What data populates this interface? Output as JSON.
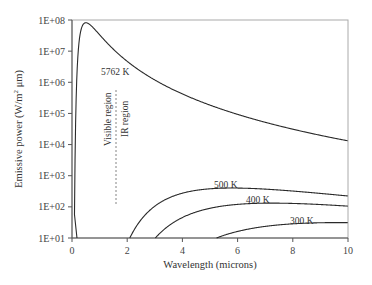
{
  "chart_data": {
    "type": "line",
    "title": "",
    "xlabel": "Wavelength (microns)",
    "ylabel": "Emissive power (W/m² μm)",
    "xlim": [
      0,
      10
    ],
    "ylim": [
      10,
      100000000
    ],
    "yscale": "log",
    "grid": false,
    "legend": "none (inline labels)",
    "x_ticks": [
      "0",
      "2",
      "4",
      "6",
      "8",
      "10"
    ],
    "y_ticks": [
      "1E+01",
      "1E+02",
      "1E+03",
      "1E+04",
      "1E+05",
      "1E+06",
      "1E+07",
      "1E+08"
    ],
    "series": [
      {
        "name": "5762 K",
        "temperature_K": 5762,
        "label": "5762 K",
        "x": [
          0.2,
          0.3,
          0.5,
          1.0,
          2.0,
          4.0,
          6.0,
          8.0,
          10.0
        ],
        "values": [
          10000000.0,
          50000000.0,
          85000000.0,
          45000000.0,
          7500000.0,
          550000.0,
          120000.0,
          39000.0,
          16000.0
        ]
      },
      {
        "name": "500 K",
        "temperature_K": 500,
        "label": "500 K",
        "x": [
          2.1,
          3.0,
          4.0,
          5.0,
          5.8,
          7.0,
          8.0,
          10.0
        ],
        "values": [
          10,
          100,
          260,
          370,
          400,
          370,
          330,
          250
        ]
      },
      {
        "name": "400 K",
        "temperature_K": 400,
        "label": "400 K",
        "x": [
          3.0,
          4.0,
          5.0,
          6.0,
          7.2,
          8.0,
          10.0
        ],
        "values": [
          10,
          45,
          95,
          130,
          145,
          140,
          120
        ]
      },
      {
        "name": "300 K",
        "temperature_K": 300,
        "label": "300 K",
        "x": [
          5.2,
          6.0,
          7.0,
          8.0,
          9.7,
          10.0
        ],
        "values": [
          10,
          15,
          22,
          28,
          31,
          31
        ]
      }
    ],
    "annotations": [
      {
        "text": "Visible region",
        "orientation": "vertical",
        "side": "left of divider"
      },
      {
        "text": "IR region",
        "orientation": "vertical",
        "side": "right of divider"
      },
      {
        "type": "dashed-vertical-line",
        "x": 1.6
      }
    ]
  },
  "labels": {
    "xlabel": "Wavelength (microns)",
    "ylabel_pre": "Emissive power (W/m",
    "ylabel_sup": "2",
    "ylabel_post": " μm)",
    "visible": "Visible region",
    "ir": "IR region",
    "t5762": "5762 K",
    "t500": "500 K",
    "t400": "400 K",
    "t300": "300 K",
    "x_ticks": [
      "0",
      "2",
      "4",
      "6",
      "8",
      "10"
    ],
    "y_ticks": [
      "1E+01",
      "1E+02",
      "1E+03",
      "1E+04",
      "1E+05",
      "1E+06",
      "1E+07",
      "1E+08"
    ]
  },
  "colors": {
    "curve": "#2a2a2a",
    "axis": "#555555",
    "frame": "#aaaaaa"
  }
}
